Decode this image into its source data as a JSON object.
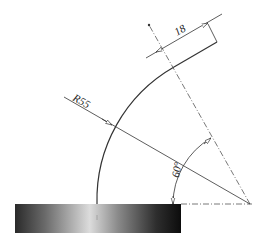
{
  "drawing": {
    "title": "Curved plate with base block",
    "dimensions": {
      "radius_label": "R55",
      "width_label": "18",
      "angle_label": "60°"
    },
    "colors": {
      "line": "#333333",
      "centerline": "#555555",
      "block_dark": "#1a1a1a",
      "block_light": "#d8d8d8"
    }
  }
}
